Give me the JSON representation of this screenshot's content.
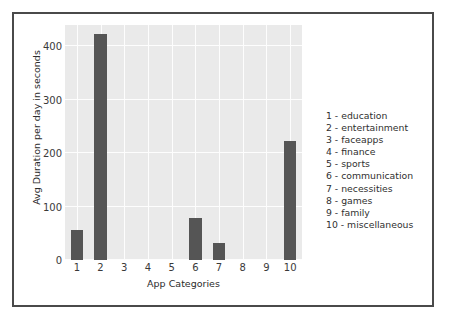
{
  "chart_data": {
    "type": "bar",
    "title": "",
    "xlabel": "App Categories",
    "ylabel": "Avg Duration per day in seconds",
    "categories": [
      "1",
      "2",
      "3",
      "4",
      "5",
      "6",
      "7",
      "8",
      "9",
      "10"
    ],
    "values": [
      57,
      423,
      0,
      0,
      0,
      78,
      32,
      0,
      0,
      222
    ],
    "series": [
      {
        "name": "Avg Duration per day in seconds",
        "values": [
          57,
          423,
          0,
          0,
          0,
          78,
          32,
          0,
          0,
          222
        ]
      }
    ],
    "ylim": [
      0,
      440
    ],
    "yticks": [
      0,
      100,
      200,
      300,
      400
    ],
    "ytick_labels": [
      "0",
      "100",
      "200",
      "300",
      "400"
    ],
    "xtick_labels": [
      "1",
      "2",
      "3",
      "4",
      "5",
      "6",
      "7",
      "8",
      "9",
      "10"
    ],
    "grid": true,
    "legend_position": "right-outside",
    "bar_color": "#555555",
    "plot_background": "#eaeaea",
    "gridline_color": "#fdfdfd",
    "frame_color": "#4a4a4a",
    "annotations": [
      "1 - education",
      "2 - entertainment",
      "3 - faceapps",
      "4 - finance",
      "5 - sports",
      "6 - communication",
      "7 - necessities",
      "8 - games",
      "9 - family",
      "10 - miscellaneous"
    ]
  },
  "legend": {
    "entries": [
      {
        "label": "1 - education"
      },
      {
        "label": "2 - entertainment"
      },
      {
        "label": "3 - faceapps"
      },
      {
        "label": "4 - finance"
      },
      {
        "label": "5 - sports"
      },
      {
        "label": "6 - communication"
      },
      {
        "label": "7 - necessities"
      },
      {
        "label": "8 - games"
      },
      {
        "label": "9 - family"
      },
      {
        "label": "10 - miscellaneous"
      }
    ]
  }
}
